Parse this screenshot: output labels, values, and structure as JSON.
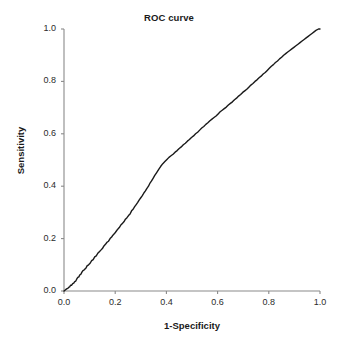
{
  "chart_data": {
    "type": "line",
    "title": "ROC curve",
    "xlabel": "1-Specificity",
    "ylabel": "Sensitivity",
    "xlim": [
      0.0,
      1.0
    ],
    "ylim": [
      0.0,
      1.0
    ],
    "grid": false,
    "legend": "none",
    "xticks": [
      "0.0",
      "0.2",
      "0.4",
      "0.6",
      "0.8",
      "1.0"
    ],
    "yticks": [
      "0.0",
      "0.2",
      "0.4",
      "0.6",
      "0.8",
      "1.0"
    ],
    "xtick_values": [
      0.0,
      0.2,
      0.4,
      0.6,
      0.8,
      1.0
    ],
    "ytick_values": [
      0.0,
      0.2,
      0.4,
      0.6,
      0.8,
      1.0
    ],
    "line_color": "#1a1a1a",
    "axis_color": "#8a8a8a",
    "background_color": "#ffffff",
    "series": [
      {
        "name": "ROC curve",
        "x": [
          0.0,
          0.005,
          0.01,
          0.015,
          0.018,
          0.022,
          0.026,
          0.03,
          0.034,
          0.038,
          0.042,
          0.046,
          0.05,
          0.054,
          0.058,
          0.062,
          0.066,
          0.07,
          0.074,
          0.078,
          0.082,
          0.086,
          0.09,
          0.096,
          0.102,
          0.108,
          0.114,
          0.12,
          0.126,
          0.132,
          0.138,
          0.144,
          0.15,
          0.156,
          0.162,
          0.168,
          0.174,
          0.18,
          0.186,
          0.192,
          0.198,
          0.204,
          0.21,
          0.216,
          0.222,
          0.228,
          0.234,
          0.24,
          0.246,
          0.252,
          0.258,
          0.264,
          0.27,
          0.276,
          0.282,
          0.288,
          0.294,
          0.3,
          0.306,
          0.312,
          0.318,
          0.324,
          0.33,
          0.336,
          0.342,
          0.348,
          0.354,
          0.362,
          0.37,
          0.378,
          0.386,
          0.394,
          0.402,
          0.41,
          0.418,
          0.426,
          0.434,
          0.442,
          0.45,
          0.458,
          0.466,
          0.474,
          0.482,
          0.49,
          0.498,
          0.506,
          0.514,
          0.522,
          0.53,
          0.538,
          0.546,
          0.554,
          0.562,
          0.57,
          0.578,
          0.586,
          0.594,
          0.602,
          0.61,
          0.618,
          0.626,
          0.634,
          0.642,
          0.65,
          0.658,
          0.666,
          0.674,
          0.682,
          0.69,
          0.698,
          0.706,
          0.714,
          0.722,
          0.73,
          0.738,
          0.746,
          0.754,
          0.762,
          0.77,
          0.778,
          0.786,
          0.794,
          0.802,
          0.81,
          0.818,
          0.826,
          0.834,
          0.842,
          0.85,
          0.858,
          0.866,
          0.874,
          0.882,
          0.89,
          0.898,
          0.906,
          0.914,
          0.922,
          0.93,
          0.938,
          0.946,
          0.954,
          0.962,
          0.97,
          0.978,
          0.986,
          0.994,
          1.0
        ],
        "y": [
          0.0,
          0.004,
          0.008,
          0.01,
          0.014,
          0.016,
          0.022,
          0.022,
          0.028,
          0.03,
          0.036,
          0.038,
          0.046,
          0.052,
          0.054,
          0.062,
          0.064,
          0.072,
          0.078,
          0.08,
          0.084,
          0.088,
          0.096,
          0.1,
          0.106,
          0.116,
          0.12,
          0.13,
          0.134,
          0.144,
          0.15,
          0.156,
          0.162,
          0.172,
          0.178,
          0.186,
          0.19,
          0.2,
          0.206,
          0.214,
          0.22,
          0.228,
          0.236,
          0.242,
          0.252,
          0.258,
          0.264,
          0.274,
          0.28,
          0.288,
          0.294,
          0.306,
          0.312,
          0.322,
          0.33,
          0.338,
          0.348,
          0.356,
          0.364,
          0.374,
          0.382,
          0.392,
          0.4,
          0.412,
          0.42,
          0.43,
          0.44,
          0.452,
          0.464,
          0.476,
          0.486,
          0.494,
          0.502,
          0.51,
          0.516,
          0.522,
          0.53,
          0.536,
          0.544,
          0.55,
          0.558,
          0.564,
          0.572,
          0.578,
          0.586,
          0.592,
          0.6,
          0.606,
          0.614,
          0.622,
          0.628,
          0.636,
          0.642,
          0.65,
          0.656,
          0.662,
          0.668,
          0.676,
          0.684,
          0.69,
          0.696,
          0.702,
          0.71,
          0.716,
          0.722,
          0.73,
          0.736,
          0.744,
          0.75,
          0.758,
          0.764,
          0.77,
          0.778,
          0.786,
          0.792,
          0.8,
          0.806,
          0.814,
          0.82,
          0.828,
          0.834,
          0.842,
          0.85,
          0.858,
          0.864,
          0.872,
          0.878,
          0.886,
          0.892,
          0.9,
          0.906,
          0.912,
          0.918,
          0.924,
          0.93,
          0.936,
          0.942,
          0.948,
          0.954,
          0.96,
          0.966,
          0.972,
          0.978,
          0.984,
          0.99,
          0.996,
          1.0,
          1.0
        ]
      }
    ]
  }
}
